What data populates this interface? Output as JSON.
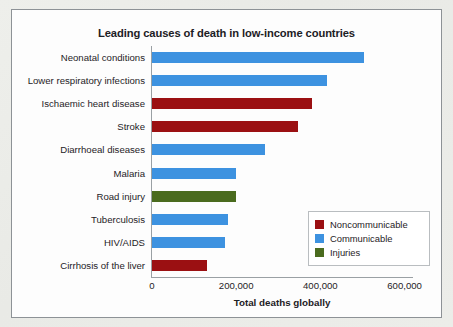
{
  "figure": {
    "background_color": "#fdfdfd",
    "border_color": "#8d9296",
    "page_color": "#edeeea"
  },
  "chart_data": {
    "type": "bar",
    "orientation": "horizontal",
    "title": "Leading causes of death in low-income countries",
    "xlabel": "Total deaths globally",
    "ylabel": "",
    "xlim": [
      0,
      620000
    ],
    "grid": false,
    "xticks": [
      0,
      200000,
      400000,
      600000
    ],
    "xtick_labels": [
      "0",
      "200,000",
      "400,000",
      "600,000"
    ],
    "categories": [
      "Neonatal conditions",
      "Lower respiratory infections",
      "Ischaemic heart disease",
      "Stroke",
      "Diarrhoeal diseases",
      "Malaria",
      "Road injury",
      "Tuberculosis",
      "HIV/AIDS",
      "Cirrhosis of the liver"
    ],
    "values": [
      504000,
      416000,
      381000,
      347000,
      268000,
      199000,
      199000,
      180000,
      173000,
      130000
    ],
    "groups": [
      "Communicable",
      "Communicable",
      "Noncommunicable",
      "Noncommunicable",
      "Communicable",
      "Communicable",
      "Injuries",
      "Communicable",
      "Communicable",
      "Noncommunicable"
    ],
    "legend": {
      "position": "lower-right",
      "entries": [
        {
          "label": "Noncommunicable",
          "color": "#9b1012"
        },
        {
          "label": "Communicable",
          "color": "#3d92e0"
        },
        {
          "label": "Injuries",
          "color": "#4a6b1e"
        }
      ]
    }
  }
}
